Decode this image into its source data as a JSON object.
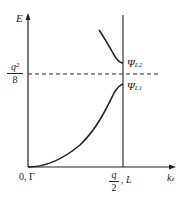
{
  "axes": {
    "y_label": "E",
    "x_label_main": "k",
    "x_label_sub": "z",
    "origin_label": "0, Γ"
  },
  "dashed_level": {
    "num": "q²",
    "den": "8"
  },
  "x_marker": {
    "num": "q",
    "den": "2",
    "suffix": ", L"
  },
  "branches": [
    {
      "label": "Ψ",
      "sub": "L2"
    },
    {
      "label": "Ψ",
      "sub": "L1"
    }
  ],
  "colors": {
    "line": "#222222",
    "background": "#ffffff"
  }
}
